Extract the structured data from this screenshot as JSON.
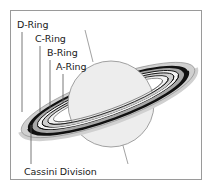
{
  "diagram": {
    "labels": {
      "d_ring": "D-Ring",
      "c_ring": "C-Ring",
      "b_ring": "B-Ring",
      "a_ring": "A-Ring",
      "cassini_division": "Cassini Division"
    },
    "colors": {
      "planet_fill": "#ededed",
      "planet_stroke": "#8a8a8a",
      "ring_outer_light": "#d0d0d0",
      "ring_dark": "#111111",
      "ring_mid": "#a8a8a8",
      "ring_gap": "#f4f4f4",
      "leader_line": "#555555",
      "frame_border": "#9a9a9a"
    }
  }
}
